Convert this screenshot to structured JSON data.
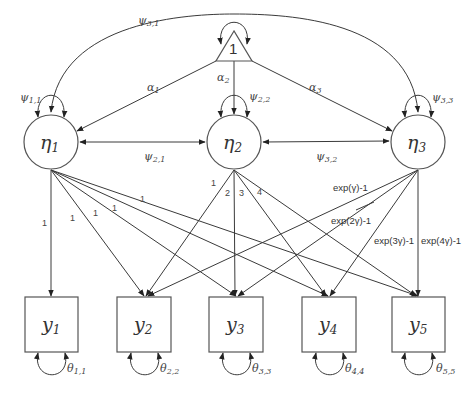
{
  "diagram": {
    "type": "structural-equation-path-diagram",
    "constant": {
      "label": "1"
    },
    "latent": [
      {
        "id": "eta1",
        "symbol": "η",
        "sub": "1",
        "variance": {
          "symbol": "ψ",
          "sub": "1,1"
        },
        "mean": {
          "symbol": "α",
          "sub": "1"
        }
      },
      {
        "id": "eta2",
        "symbol": "η",
        "sub": "2",
        "variance": {
          "symbol": "ψ",
          "sub": "2,2"
        },
        "mean": {
          "symbol": "α",
          "sub": "2"
        }
      },
      {
        "id": "eta3",
        "symbol": "η",
        "sub": "3",
        "variance": {
          "symbol": "ψ",
          "sub": "3,3"
        },
        "mean": {
          "symbol": "α",
          "sub": "3"
        }
      }
    ],
    "covariances": [
      {
        "symbol": "ψ",
        "sub": "2,1"
      },
      {
        "symbol": "ψ",
        "sub": "3,2"
      },
      {
        "symbol": "ψ",
        "sub": "3,1"
      }
    ],
    "observed": [
      {
        "id": "y1",
        "symbol": "y",
        "sub": "1",
        "residual": {
          "symbol": "θ",
          "sub": "1,1"
        }
      },
      {
        "id": "y2",
        "symbol": "y",
        "sub": "2",
        "residual": {
          "symbol": "θ",
          "sub": "2,2"
        }
      },
      {
        "id": "y3",
        "symbol": "y",
        "sub": "3",
        "residual": {
          "symbol": "θ",
          "sub": "3,3"
        }
      },
      {
        "id": "y4",
        "symbol": "y",
        "sub": "4",
        "residual": {
          "symbol": "θ",
          "sub": "4,4"
        }
      },
      {
        "id": "y5",
        "symbol": "y",
        "sub": "5",
        "residual": {
          "symbol": "θ",
          "sub": "5,5"
        }
      }
    ],
    "loadings": {
      "eta1": [
        "1",
        "1",
        "1",
        "1",
        "1"
      ],
      "eta2": [
        "1",
        "2",
        "3",
        "4"
      ],
      "eta3": [
        "exp(γ)-1",
        "exp(2γ)-1",
        "exp(3γ)-1",
        "exp(4γ)-1"
      ]
    }
  }
}
